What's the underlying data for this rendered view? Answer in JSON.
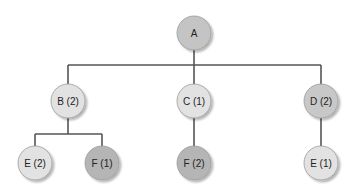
{
  "diagram": {
    "type": "tree",
    "colors": {
      "edge": "#555555",
      "light_node": "#e2e2e2",
      "medium_node": "#c4c4c4",
      "dark_node": "#b3b3b3",
      "node_border": "#9a9a9a",
      "text": "#222222"
    },
    "nodes": [
      {
        "id": "A",
        "label": "A",
        "parent": null
      },
      {
        "id": "B",
        "label": "B (2)",
        "parent": "A"
      },
      {
        "id": "C",
        "label": "C (1)",
        "parent": "A"
      },
      {
        "id": "D",
        "label": "D (2)",
        "parent": "A"
      },
      {
        "id": "BE",
        "label": "E (2)",
        "parent": "B"
      },
      {
        "id": "BF",
        "label": "F (1)",
        "parent": "B"
      },
      {
        "id": "CF",
        "label": "F (2)",
        "parent": "C"
      },
      {
        "id": "DE",
        "label": "E (1)",
        "parent": "D"
      }
    ]
  }
}
